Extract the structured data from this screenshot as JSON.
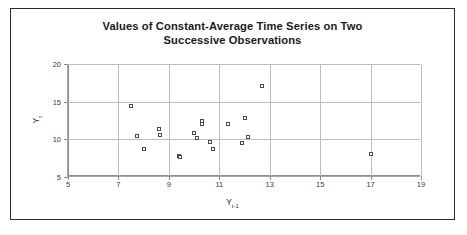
{
  "figure": {
    "title_line1": "Values of Constant-Average Time Series on Two",
    "title_line2": "Successive Observations",
    "border_color": "#2b2b2b",
    "background": "#ffffff"
  },
  "axes": {
    "ylabel_main": "Y",
    "ylabel_sub": "t",
    "xlabel_main": "Y",
    "xlabel_sub": "t-1"
  },
  "chart_data": {
    "type": "scatter",
    "title": "Values of Constant-Average Time Series on Two Successive Observations",
    "xlabel": "Y t-1",
    "ylabel": "Y t",
    "xlim": [
      5,
      19
    ],
    "ylim": [
      5,
      20
    ],
    "xticks": [
      5,
      7,
      9,
      11,
      13,
      15,
      17,
      19
    ],
    "yticks": [
      5,
      10,
      15,
      20
    ],
    "grid": true,
    "legend": null,
    "marker": "open-square",
    "marker_color": "#4a4a4a",
    "points": [
      {
        "x": 7.5,
        "y": 14.4
      },
      {
        "x": 7.75,
        "y": 10.4
      },
      {
        "x": 8.0,
        "y": 8.7
      },
      {
        "x": 8.6,
        "y": 11.4
      },
      {
        "x": 8.65,
        "y": 10.6
      },
      {
        "x": 9.4,
        "y": 7.8
      },
      {
        "x": 9.45,
        "y": 7.65
      },
      {
        "x": 10.0,
        "y": 10.8
      },
      {
        "x": 10.1,
        "y": 10.2
      },
      {
        "x": 10.3,
        "y": 12.4
      },
      {
        "x": 10.3,
        "y": 12.0
      },
      {
        "x": 10.65,
        "y": 9.6
      },
      {
        "x": 10.75,
        "y": 8.7
      },
      {
        "x": 11.35,
        "y": 12.1
      },
      {
        "x": 11.9,
        "y": 9.55
      },
      {
        "x": 12.0,
        "y": 12.8
      },
      {
        "x": 12.15,
        "y": 10.3
      },
      {
        "x": 12.7,
        "y": 17.1
      },
      {
        "x": 17.0,
        "y": 8.1
      }
    ]
  }
}
